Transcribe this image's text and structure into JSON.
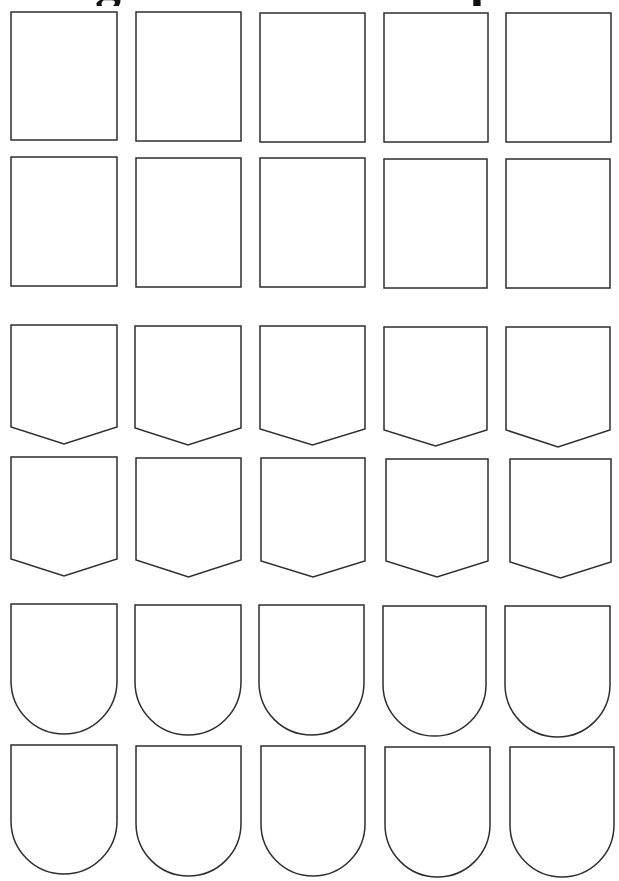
{
  "page": {
    "title_fragments": [
      {
        "char": "g",
        "class": "g"
      },
      {
        "char": "p",
        "class": "p"
      }
    ],
    "stroke_color": "#2e2e2e",
    "background_color": "#ffffff"
  },
  "grid": {
    "columns": 5,
    "rows": [
      {
        "shape": "rectangle",
        "items": [
          {
            "x": 11,
            "y": 12,
            "w": 106,
            "h": 128
          },
          {
            "x": 136,
            "y": 12,
            "w": 105,
            "h": 129
          },
          {
            "x": 260,
            "y": 13,
            "w": 105,
            "h": 129
          },
          {
            "x": 384,
            "y": 13,
            "w": 104,
            "h": 129
          },
          {
            "x": 506,
            "y": 13,
            "w": 105,
            "h": 129
          }
        ]
      },
      {
        "shape": "rectangle",
        "items": [
          {
            "x": 11,
            "y": 157,
            "w": 106,
            "h": 129
          },
          {
            "x": 136,
            "y": 158,
            "w": 105,
            "h": 129
          },
          {
            "x": 260,
            "y": 158,
            "w": 105,
            "h": 129
          },
          {
            "x": 384,
            "y": 159,
            "w": 103,
            "h": 129
          },
          {
            "x": 506,
            "y": 159,
            "w": 104,
            "h": 129
          }
        ]
      },
      {
        "shape": "pointed-shield",
        "items": [
          {
            "x": 11,
            "y": 325,
            "w": 106,
            "side": 102,
            "tip": 119
          },
          {
            "x": 135,
            "y": 326,
            "w": 106,
            "side": 102,
            "tip": 119
          },
          {
            "x": 260,
            "y": 326,
            "w": 105,
            "side": 103,
            "tip": 119
          },
          {
            "x": 384,
            "y": 327,
            "w": 103,
            "side": 103,
            "tip": 119
          },
          {
            "x": 506,
            "y": 327,
            "w": 104,
            "side": 103,
            "tip": 120
          }
        ]
      },
      {
        "shape": "pointed-shield",
        "items": [
          {
            "x": 11,
            "y": 457,
            "w": 106,
            "side": 102,
            "tip": 119
          },
          {
            "x": 136,
            "y": 458,
            "w": 105,
            "side": 102,
            "tip": 119
          },
          {
            "x": 261,
            "y": 458,
            "w": 104,
            "side": 103,
            "tip": 119
          },
          {
            "x": 386,
            "y": 459,
            "w": 102,
            "side": 102,
            "tip": 118
          },
          {
            "x": 510,
            "y": 459,
            "w": 101,
            "side": 103,
            "tip": 119
          }
        ]
      },
      {
        "shape": "round-shield",
        "items": [
          {
            "x": 11,
            "y": 604,
            "w": 106,
            "h": 130
          },
          {
            "x": 135,
            "y": 605,
            "w": 106,
            "h": 130
          },
          {
            "x": 259,
            "y": 605,
            "w": 105,
            "h": 130
          },
          {
            "x": 383,
            "y": 606,
            "w": 103,
            "h": 130
          },
          {
            "x": 505,
            "y": 606,
            "w": 105,
            "h": 131
          }
        ]
      },
      {
        "shape": "round-shield",
        "items": [
          {
            "x": 11,
            "y": 745,
            "w": 106,
            "h": 129
          },
          {
            "x": 136,
            "y": 746,
            "w": 105,
            "h": 130
          },
          {
            "x": 261,
            "y": 746,
            "w": 104,
            "h": 130
          },
          {
            "x": 385,
            "y": 747,
            "w": 105,
            "h": 130
          },
          {
            "x": 510,
            "y": 747,
            "w": 104,
            "h": 130
          }
        ]
      }
    ]
  }
}
